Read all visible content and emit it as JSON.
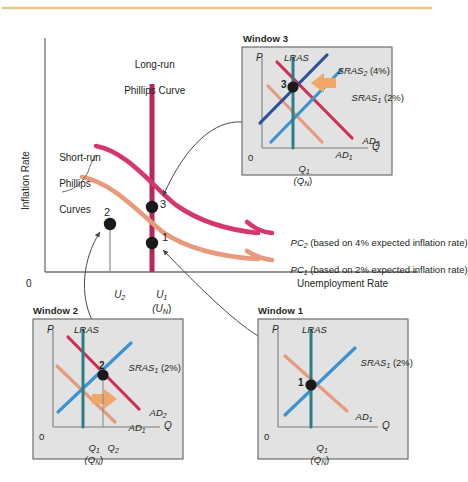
{
  "figure": {
    "type": "diagram",
    "topic": "Phillips Curve and AD-AS adjustment",
    "top_rule_color": "#e8c98a"
  },
  "main_chart": {
    "y_axis_label": "Inflation Rate",
    "x_axis_label": "Unemployment Rate",
    "origin_label": "0",
    "axis_color": "#6f6f6f",
    "annotations": {
      "lrpc_label_line1": "Long-run",
      "lrpc_label_line2": "Phillips Curve",
      "srpc_label_line1": "Short-run",
      "srpc_label_line2": "Phillips",
      "srpc_label_line3": "Curves"
    },
    "x_ticks": [
      {
        "label": "U",
        "sub": "2"
      },
      {
        "label": "U",
        "sub": "1"
      },
      {
        "label": "(U",
        "sub": "N",
        "tail": ")"
      }
    ],
    "points": [
      {
        "id": "1",
        "label": "1"
      },
      {
        "id": "2",
        "label": "2"
      },
      {
        "id": "3",
        "label": "3"
      }
    ],
    "curve_legend": [
      {
        "name": "PC",
        "sub": "2",
        "text": " (based on 4% expected inflation rate)",
        "color": "#d6376a"
      },
      {
        "name": "PC",
        "sub": "1",
        "text": " (based on 2% expected inflation rate)",
        "color": "#e89a7c"
      }
    ],
    "colors": {
      "lrpc": "#b8275a",
      "pc2": "#d6376a",
      "pc1": "#e89a7c",
      "point": "#1a1a1a",
      "leader": "#4a4a4a"
    }
  },
  "windows": [
    {
      "id": "window1",
      "title": "Window 1",
      "y_axis_label": "P",
      "x_axis_label": "Q",
      "origin_label": "0",
      "bg": "#e2e2e2",
      "border": "#6e6e6e",
      "curves": [
        {
          "name": "LRAS",
          "sub": "",
          "suffix": "",
          "color": "#2b7f84"
        },
        {
          "name": "SRAS",
          "sub": "1",
          "suffix": " (2%)",
          "color": "#3d92d1"
        },
        {
          "name": "AD",
          "sub": "1",
          "suffix": "",
          "color": "#e89a7c"
        }
      ],
      "point": "1",
      "x_ticks": [
        {
          "label": "Q",
          "sub": "1"
        },
        {
          "label": "(Q",
          "sub": "N",
          "tail": ")"
        }
      ]
    },
    {
      "id": "window2",
      "title": "Window 2",
      "y_axis_label": "P",
      "x_axis_label": "Q",
      "origin_label": "0",
      "bg": "#e2e2e2",
      "border": "#6e6e6e",
      "curves": [
        {
          "name": "LRAS",
          "sub": "",
          "suffix": "",
          "color": "#2b7f84"
        },
        {
          "name": "SRAS",
          "sub": "1",
          "suffix": " (2%)",
          "color": "#3d92d1"
        },
        {
          "name": "AD",
          "sub": "2",
          "suffix": "",
          "color": "#cf2f52"
        },
        {
          "name": "AD",
          "sub": "1",
          "suffix": "",
          "color": "#e89a7c"
        }
      ],
      "point": "2",
      "shift_arrow_color": "#f0a868",
      "x_ticks": [
        {
          "label": "Q",
          "sub": "1"
        },
        {
          "label": "Q",
          "sub": "2"
        },
        {
          "label": "(Q",
          "sub": "N",
          "tail": ")"
        }
      ]
    },
    {
      "id": "window3",
      "title": "Window 3",
      "y_axis_label": "P",
      "x_axis_label": "Q",
      "origin_label": "0",
      "bg": "#e2e2e2",
      "border": "#6e6e6e",
      "curves": [
        {
          "name": "LRAS",
          "sub": "",
          "suffix": "",
          "color": "#2b7f84"
        },
        {
          "name": "SRAS",
          "sub": "2",
          "suffix": " (4%)",
          "color": "#2b4f99"
        },
        {
          "name": "SRAS",
          "sub": "1",
          "suffix": " (2%)",
          "color": "#3d92d1"
        },
        {
          "name": "AD",
          "sub": "2",
          "suffix": "",
          "color": "#cf2f52"
        },
        {
          "name": "AD",
          "sub": "1",
          "suffix": "",
          "color": "#e89a7c"
        }
      ],
      "point": "3",
      "shift_arrow_color": "#f0a868",
      "x_ticks": [
        {
          "label": "Q",
          "sub": "1"
        },
        {
          "label": "(Q",
          "sub": "N",
          "tail": ")"
        }
      ]
    }
  ]
}
